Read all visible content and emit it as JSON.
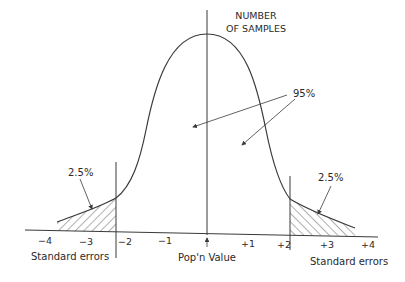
{
  "diagram": {
    "type": "normal-distribution-sampling",
    "y_axis_label": [
      "NUMBER",
      "OF SAMPLES"
    ],
    "center_label": "Pop'n Value",
    "left_axis_label": "Standard errors",
    "right_axis_label": "Standard errors",
    "central_area_label": "95%",
    "left_tail_label": "2.5%",
    "right_tail_label": "2.5%",
    "ticks": {
      "neg4": "−4",
      "neg3": "−3",
      "neg2": "−2",
      "neg1": "−1",
      "pos1": "+1",
      "pos2": "+2",
      "pos3": "+3",
      "pos4": "+4"
    },
    "colors": {
      "line": "#3a3a3a",
      "text": "#2a2a2a",
      "background": "#ffffff"
    }
  }
}
